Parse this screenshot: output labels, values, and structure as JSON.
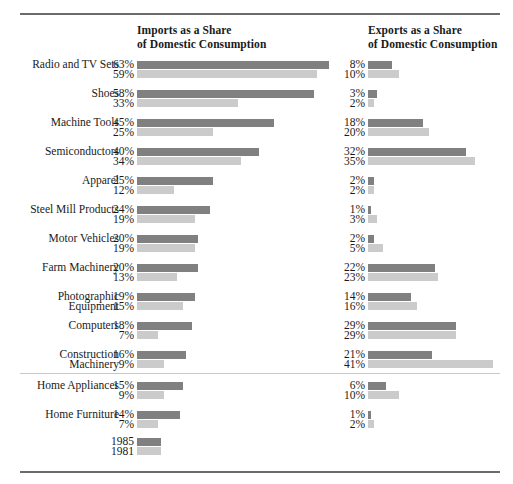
{
  "headers": {
    "imports_line1": "Imports as a Share",
    "imports_line2": "of Domestic Consumption",
    "exports_line1": "Exports as a Share",
    "exports_line2": "of Domestic Consumption"
  },
  "legend": {
    "series_1_label": "1985",
    "series_2_label": "1981",
    "series_1_color": "#808080",
    "series_2_color": "#cbcbcb"
  },
  "rows": [
    {
      "cat_line1": "Radio and TV Sets",
      "cat_line2": "",
      "imp_1985": "63%",
      "imp_1981": "59%",
      "exp_1985": "8%",
      "exp_1981": "10%"
    },
    {
      "cat_line1": "Shoes",
      "cat_line2": "",
      "imp_1985": "58%",
      "imp_1981": "33%",
      "exp_1985": "3%",
      "exp_1981": "2%"
    },
    {
      "cat_line1": "Machine Tools",
      "cat_line2": "",
      "imp_1985": "45%",
      "imp_1981": "25%",
      "exp_1985": "18%",
      "exp_1981": "20%"
    },
    {
      "cat_line1": "Semiconductors",
      "cat_line2": "",
      "imp_1985": "40%",
      "imp_1981": "34%",
      "exp_1985": "32%",
      "exp_1981": "35%"
    },
    {
      "cat_line1": "Apparel",
      "cat_line2": "",
      "imp_1985": "25%",
      "imp_1981": "12%",
      "exp_1985": "2%",
      "exp_1981": "2%"
    },
    {
      "cat_line1": "Steel Mill Products",
      "cat_line2": "",
      "imp_1985": "24%",
      "imp_1981": "19%",
      "exp_1985": "1%",
      "exp_1981": "3%"
    },
    {
      "cat_line1": "Motor Vehicles",
      "cat_line2": "",
      "imp_1985": "20%",
      "imp_1981": "19%",
      "exp_1985": "2%",
      "exp_1981": "5%"
    },
    {
      "cat_line1": "Farm Machinery",
      "cat_line2": "",
      "imp_1985": "20%",
      "imp_1981": "13%",
      "exp_1985": "22%",
      "exp_1981": "23%"
    },
    {
      "cat_line1": "Photographic",
      "cat_line2": "Equipment",
      "imp_1985": "19%",
      "imp_1981": "15%",
      "exp_1985": "14%",
      "exp_1981": "16%"
    },
    {
      "cat_line1": "Computers",
      "cat_line2": "",
      "imp_1985": "18%",
      "imp_1981": "7%",
      "exp_1985": "29%",
      "exp_1981": "29%"
    },
    {
      "cat_line1": "Construction",
      "cat_line2": "Machinery",
      "imp_1985": "16%",
      "imp_1981": "9%",
      "exp_1985": "21%",
      "exp_1981": "41%"
    },
    {
      "cat_line1": "Home Appliances",
      "cat_line2": "",
      "imp_1985": "15%",
      "imp_1981": "9%",
      "exp_1985": "6%",
      "exp_1981": "10%"
    },
    {
      "cat_line1": "Home Furniture",
      "cat_line2": "",
      "imp_1985": "14%",
      "imp_1981": "7%",
      "exp_1985": "1%",
      "exp_1981": "2%"
    }
  ],
  "chart_data": {
    "type": "bar",
    "title": "",
    "orientation": "horizontal",
    "grid": false,
    "legend_position": "bottom-left",
    "xlabel": "",
    "ylabel": "",
    "xlim": [
      0,
      63
    ],
    "px_per_percent": 3.05,
    "panels": [
      {
        "name": "imports",
        "title": "Imports as a Share of Domestic Consumption",
        "categories": [
          "Radio and TV Sets",
          "Shoes",
          "Machine Tools",
          "Semiconductors",
          "Apparel",
          "Steel Mill Products",
          "Motor Vehicles",
          "Farm Machinery",
          "Photographic Equipment",
          "Computers",
          "Construction Machinery",
          "Home Appliances",
          "Home Furniture"
        ],
        "series": [
          {
            "name": "1985",
            "color": "#808080",
            "values": [
              63,
              58,
              45,
              40,
              25,
              24,
              20,
              20,
              19,
              18,
              16,
              15,
              14
            ]
          },
          {
            "name": "1981",
            "color": "#cbcbcb",
            "values": [
              59,
              33,
              25,
              34,
              12,
              19,
              19,
              13,
              15,
              7,
              9,
              9,
              7
            ]
          }
        ]
      },
      {
        "name": "exports",
        "title": "Exports as a Share of Domestic Consumption",
        "categories": [
          "Radio and TV Sets",
          "Shoes",
          "Machine Tools",
          "Semiconductors",
          "Apparel",
          "Steel Mill Products",
          "Motor Vehicles",
          "Farm Machinery",
          "Photographic Equipment",
          "Computers",
          "Construction Machinery",
          "Home Appliances",
          "Home Furniture"
        ],
        "series": [
          {
            "name": "1985",
            "color": "#808080",
            "values": [
              8,
              3,
              18,
              32,
              2,
              1,
              2,
              22,
              14,
              29,
              21,
              6,
              1
            ]
          },
          {
            "name": "1981",
            "color": "#cbcbcb",
            "values": [
              10,
              2,
              20,
              35,
              2,
              3,
              5,
              23,
              16,
              29,
              41,
              10,
              2
            ]
          }
        ]
      }
    ]
  }
}
